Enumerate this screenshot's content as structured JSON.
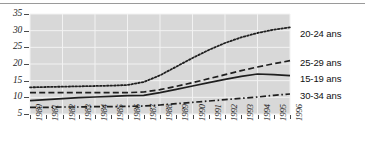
{
  "chart_data": {
    "type": "line",
    "title": "",
    "xlabel": "",
    "ylabel": "",
    "grid": true,
    "legend_position": "right",
    "plot_background": "#d8d8d8",
    "xlim": [
      1980,
      1996
    ],
    "ylim": [
      5,
      35
    ],
    "x": [
      1980,
      1981,
      1982,
      1983,
      1984,
      1985,
      1986,
      1987,
      1988,
      1989,
      1990,
      1991,
      1992,
      1993,
      1994,
      1995,
      1996
    ],
    "xtick_labels": [
      "1980",
      "1981",
      "1982",
      "1983",
      "1984",
      "1985",
      "1986",
      "1987",
      "1988",
      "1989",
      "1990",
      "1991",
      "1992",
      "1993",
      "1994",
      "1995",
      "1996"
    ],
    "ytick_labels": [
      "5",
      "10",
      "15",
      "20",
      "25",
      "30",
      "35"
    ],
    "ytick_values": [
      5,
      10,
      15,
      20,
      25,
      30,
      35
    ],
    "series": [
      {
        "name": "20-24 ans",
        "style": "dotted",
        "color": "#1f1f1f",
        "values": [
          13.0,
          13.1,
          13.2,
          13.3,
          13.4,
          13.5,
          13.7,
          14.6,
          16.6,
          19.2,
          21.8,
          24.2,
          26.3,
          28.0,
          29.3,
          30.3,
          31.0
        ]
      },
      {
        "name": "25-29 ans",
        "style": "dashed",
        "color": "#1f1f1f",
        "values": [
          11.4,
          11.4,
          11.4,
          11.4,
          11.4,
          11.4,
          11.4,
          11.6,
          12.3,
          13.3,
          14.4,
          15.6,
          16.8,
          18.0,
          19.1,
          20.1,
          21.0
        ]
      },
      {
        "name": "15-19 ans",
        "style": "solid",
        "color": "#1f1f1f",
        "values": [
          9.0,
          9.3,
          9.6,
          9.9,
          10.1,
          10.3,
          10.5,
          10.6,
          11.4,
          12.4,
          13.4,
          14.4,
          15.4,
          16.3,
          17.0,
          16.8,
          16.5
        ]
      },
      {
        "name": "30-34 ans",
        "style": "dashdot",
        "color": "#1f1f1f",
        "values": [
          7.0,
          7.0,
          7.1,
          7.1,
          7.2,
          7.2,
          7.3,
          7.4,
          7.7,
          8.1,
          8.5,
          8.9,
          9.3,
          9.7,
          10.1,
          10.6,
          11.0
        ]
      }
    ],
    "legend": [
      {
        "label": "20-24 ans",
        "style": "dotted"
      },
      {
        "label": "25-29 ans",
        "style": "dashed"
      },
      {
        "label": "15-19 ans",
        "style": "solid"
      },
      {
        "label": "30-34 ans",
        "style": "dashdot"
      }
    ]
  }
}
